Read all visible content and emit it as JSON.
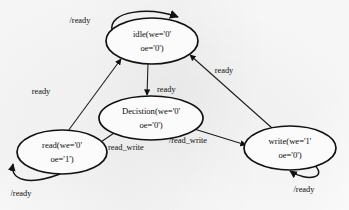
{
  "diagram": {
    "kind": "finite-state-machine",
    "background_color": "#fbfbfb",
    "line_color": "#111111",
    "states": [
      {
        "id": "idle",
        "line1": "idle(we='0'",
        "line2": "oe='0')",
        "cx": 152,
        "cy": 41,
        "rx": 46,
        "ry": 23
      },
      {
        "id": "decistion",
        "line1": "Decistion(we='0'",
        "line2": "oe='0')",
        "cx": 151,
        "cy": 118,
        "rx": 52,
        "ry": 22
      },
      {
        "id": "read",
        "line1": "read(we='0'",
        "line2": "oe='1')",
        "cx": 62,
        "cy": 152,
        "rx": 45,
        "ry": 22
      },
      {
        "id": "write",
        "line1": "write(we='1'",
        "line2": "oe='0')",
        "cx": 290,
        "cy": 148,
        "rx": 46,
        "ry": 22
      }
    ],
    "transitions": [
      {
        "id": "idle-self",
        "from": "idle",
        "to": "idle",
        "label": "/ready",
        "label_x": 80,
        "label_y": 21
      },
      {
        "id": "idle-to-decistion",
        "from": "idle",
        "to": "decistion",
        "label": "ready",
        "label_x": 157,
        "label_y": 90
      },
      {
        "id": "decistion-to-read",
        "from": "decistion",
        "to": "read",
        "label": "read_write",
        "label_x": 108,
        "label_y": 148
      },
      {
        "id": "decistion-to-write",
        "from": "decistion",
        "to": "write",
        "label": "/read_write",
        "label_x": 188,
        "label_y": 141
      },
      {
        "id": "read-to-idle",
        "from": "read",
        "to": "idle",
        "label": "ready",
        "label_x": 41,
        "label_y": 92
      },
      {
        "id": "write-to-idle",
        "from": "write",
        "to": "idle",
        "label": "ready",
        "label_x": 224,
        "label_y": 71
      },
      {
        "id": "read-self",
        "from": "read",
        "to": "read",
        "label": "/ready",
        "label_x": 21,
        "label_y": 194
      },
      {
        "id": "write-self",
        "from": "write",
        "to": "write",
        "label": "/ready",
        "label_x": 304,
        "label_y": 190
      }
    ]
  }
}
